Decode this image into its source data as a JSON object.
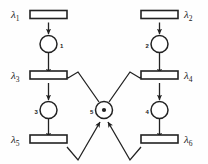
{
  "diagram": {
    "type": "petri-net",
    "width": 208,
    "height": 164,
    "background_color": "#fefefe",
    "stroke_color": "#222222",
    "fill_color": "#ffffff"
  },
  "transitions": [
    {
      "id": "t1",
      "label": "λ",
      "sub": "1",
      "x": 48.5,
      "y": 14.5,
      "w": 37,
      "h": 8,
      "label_x": 14,
      "label_y": 18
    },
    {
      "id": "t2",
      "label": "λ",
      "sub": "2",
      "x": 159.5,
      "y": 14.5,
      "w": 37,
      "h": 8,
      "label_x": 183,
      "label_y": 18
    },
    {
      "id": "t3",
      "label": "λ",
      "sub": "3",
      "x": 48.5,
      "y": 75,
      "w": 37,
      "h": 8,
      "label_x": 14,
      "label_y": 78.5
    },
    {
      "id": "t4",
      "label": "λ",
      "sub": "4",
      "x": 159.5,
      "y": 75,
      "w": 37,
      "h": 8,
      "label_x": 183,
      "label_y": 78.5
    },
    {
      "id": "t5",
      "label": "λ",
      "sub": "5",
      "x": 48.5,
      "y": 139,
      "w": 37,
      "h": 8,
      "label_x": 14,
      "label_y": 142.5
    },
    {
      "id": "t6",
      "label": "λ",
      "sub": "6",
      "x": 159.5,
      "y": 139,
      "w": 37,
      "h": 8,
      "label_x": 183,
      "label_y": 142.5
    }
  ],
  "places": [
    {
      "id": "p1",
      "number": "1",
      "cx": 48.5,
      "cy": 44,
      "r": 8.5,
      "tokens": 0,
      "num_x": 60,
      "num_y": 47.5
    },
    {
      "id": "p2",
      "number": "2",
      "cx": 159.5,
      "cy": 44,
      "r": 8.5,
      "tokens": 0,
      "num_x": 147.5,
      "num_y": 47.5
    },
    {
      "id": "p3",
      "number": "3",
      "cx": 48.5,
      "cy": 110,
      "r": 8.5,
      "tokens": 0,
      "num_x": 36.5,
      "num_y": 113.5
    },
    {
      "id": "p4",
      "number": "4",
      "cx": 159.5,
      "cy": 110,
      "r": 8.5,
      "tokens": 0,
      "num_x": 147.5,
      "num_y": 113.5
    },
    {
      "id": "p5",
      "number": "5",
      "cx": 104,
      "cy": 110,
      "r": 8.5,
      "tokens": 1,
      "num_x": 91.5,
      "num_y": 113.5
    }
  ],
  "arcs": [
    {
      "id": "a-t1-p1",
      "from": "t1",
      "to": "p1",
      "kind": "straight-down"
    },
    {
      "id": "a-p1-t3",
      "from": "p1",
      "to": "t3",
      "kind": "straight-down"
    },
    {
      "id": "a-t3-p3",
      "from": "t3",
      "to": "p3",
      "kind": "straight-down"
    },
    {
      "id": "a-p3-t5",
      "from": "p3",
      "to": "t5",
      "kind": "straight-down"
    },
    {
      "id": "a-t2-p2",
      "from": "t2",
      "to": "p2",
      "kind": "straight-down"
    },
    {
      "id": "a-p2-t4",
      "from": "p2",
      "to": "t4",
      "kind": "straight-down"
    },
    {
      "id": "a-t4-p4",
      "from": "t4",
      "to": "p4",
      "kind": "straight-down"
    },
    {
      "id": "a-p4-t6",
      "from": "p4",
      "to": "t6",
      "kind": "straight-down"
    },
    {
      "id": "a-p5-t3",
      "from": "p5",
      "to": "t3",
      "kind": "polyline-up-left"
    },
    {
      "id": "a-p5-t4",
      "from": "p5",
      "to": "t4",
      "kind": "polyline-up-right"
    },
    {
      "id": "a-t5-p5",
      "from": "t5",
      "to": "p5",
      "kind": "polyline-down-right"
    },
    {
      "id": "a-t6-p5",
      "from": "t6",
      "to": "p5",
      "kind": "polyline-down-left"
    }
  ]
}
